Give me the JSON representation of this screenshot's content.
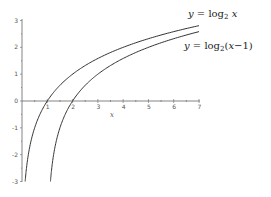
{
  "chart_data": {
    "type": "line",
    "title": "",
    "xlabel": "x",
    "ylabel": "",
    "xlim": [
      0,
      7
    ],
    "ylim": [
      -3,
      3
    ],
    "grid": false,
    "legend": "inline labels at right end of curves",
    "x_ticks": [
      "1",
      "2",
      "3",
      "4",
      "5",
      "6",
      "7"
    ],
    "y_ticks": [
      "-3",
      "-2",
      "-1",
      "0",
      "1",
      "2",
      "3"
    ],
    "series": [
      {
        "name": "y = log2 x",
        "label_parts": [
          "y",
          " = log",
          "2",
          " ",
          "x",
          ""
        ],
        "x": [
          0.125,
          0.25,
          0.5,
          1,
          2,
          3,
          4,
          5,
          6,
          7
        ],
        "values": [
          -3,
          -2,
          -1,
          0,
          1,
          1.585,
          2,
          2.322,
          2.585,
          2.807
        ]
      },
      {
        "name": "y = log2 (x-1)",
        "label_parts": [
          "y",
          " = log",
          "2",
          "(",
          "x",
          "−1)"
        ],
        "x": [
          1.125,
          1.25,
          1.5,
          2,
          3,
          4,
          5,
          6,
          7
        ],
        "values": [
          -3,
          -2,
          -1,
          0,
          1,
          1.585,
          2,
          2.322,
          2.585
        ]
      }
    ]
  }
}
